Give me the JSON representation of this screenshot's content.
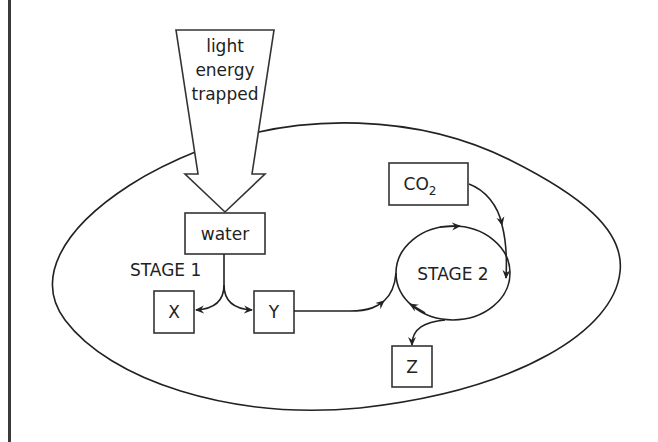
{
  "diagram": {
    "light_arrow": {
      "lines": [
        "light",
        "energy",
        "trapped"
      ]
    },
    "boxes": {
      "water": "water",
      "x": "X",
      "y": "Y",
      "co2": "CO",
      "co2_sub": "2",
      "z": "Z"
    },
    "labels": {
      "stage1": "STAGE 1",
      "stage2": "STAGE 2"
    },
    "colors": {
      "line": "#222222",
      "background": "#ffffff",
      "frame": "#3a3a3a"
    }
  }
}
